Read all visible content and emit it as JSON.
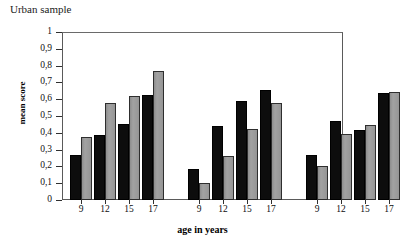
{
  "chart_data": {
    "type": "bar",
    "title": "Urban sample",
    "xlabel": "age in years",
    "ylabel": "mean score",
    "ylim": [
      0,
      1
    ],
    "ytick_labels": [
      "0",
      "0,1",
      "0,2",
      "0,3",
      "0,4",
      "0,5",
      "0,6",
      "0,7",
      "0,8",
      "0,9",
      "1"
    ],
    "ytick_values": [
      0,
      0.1,
      0.2,
      0.3,
      0.4,
      0.5,
      0.6,
      0.7,
      0.8,
      0.9,
      1
    ],
    "grid": false,
    "legend": "none",
    "categories": [
      "9",
      "12",
      "15",
      "17",
      "9",
      "12",
      "15",
      "17",
      "9",
      "12",
      "15",
      "17"
    ],
    "groups": [
      {
        "name": "group-1",
        "categories": [
          "9",
          "12",
          "15",
          "17"
        ],
        "series": [
          {
            "name": "black",
            "color": "#0d0d0d",
            "values": [
              0.27,
              0.385,
              0.45,
              0.625
            ]
          },
          {
            "name": "gray",
            "color": "#9a9a9a",
            "values": [
              0.375,
              0.58,
              0.62,
              0.765
            ]
          }
        ]
      },
      {
        "name": "group-2",
        "categories": [
          "9",
          "12",
          "15",
          "17"
        ],
        "series": [
          {
            "name": "black",
            "color": "#0d0d0d",
            "values": [
              0.185,
              0.44,
              0.59,
              0.655
            ]
          },
          {
            "name": "gray",
            "color": "#9a9a9a",
            "values": [
              0.1,
              0.26,
              0.42,
              0.575
            ]
          }
        ]
      },
      {
        "name": "group-3",
        "categories": [
          "9",
          "12",
          "15",
          "17"
        ],
        "series": [
          {
            "name": "black",
            "color": "#0d0d0d",
            "values": [
              0.265,
              0.47,
              0.415,
              0.635
            ]
          },
          {
            "name": "gray",
            "color": "#9a9a9a",
            "values": [
              0.205,
              0.395,
              0.445,
              0.645
            ]
          }
        ]
      }
    ]
  }
}
